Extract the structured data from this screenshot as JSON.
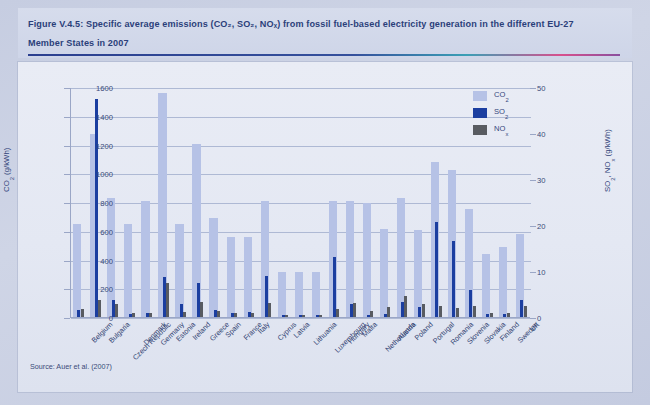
{
  "figure": {
    "title_line1": "Figure V.4.5: Specific average emissions (CO₂, SO₂, NOₓ) from fossil fuel-based electricity generation in the different EU-27",
    "title_line2": "Member States in 2007",
    "source": "Source: Auer et al. (2007)"
  },
  "colors": {
    "co2": "#b6c2e6",
    "so2": "#1b3ea0",
    "nox": "#585b61",
    "title_text": "#2b3f7a",
    "grid": "#aeb9d4",
    "panel_bg": "#e6eaf3"
  },
  "legend": {
    "position": "top-right",
    "entries": [
      {
        "label": "CO₂",
        "color": "#b6c2e6"
      },
      {
        "label": "SO₂",
        "color": "#1b3ea0"
      },
      {
        "label": "NOₓ",
        "color": "#585b61"
      }
    ]
  },
  "chart_data": {
    "type": "bar",
    "title": "Figure V.4.5: Specific average emissions (CO₂, SO₂, NOₓ) from fossil fuel-based electricity generation in the different EU-27 Member States in 2007",
    "xlabel": "",
    "ylabel": "CO₂ (g/kWh)",
    "y2label": "SO₂, NOₓ (g/kWh)",
    "ylim": [
      0,
      1600
    ],
    "y2lim": [
      0,
      50
    ],
    "yticks": [
      0,
      200,
      400,
      600,
      800,
      1000,
      1200,
      1400,
      1600
    ],
    "y2ticks": [
      0,
      10,
      20,
      30,
      40,
      50
    ],
    "grid": true,
    "legend_position": "top-right",
    "categories": [
      "Belgium",
      "Bulgaria",
      "Czech Republic",
      "Denmark",
      "Germany",
      "Estonia",
      "Ireland",
      "Greece",
      "Spain",
      "France",
      "Italy",
      "Cyprus",
      "Latvia",
      "Lithuania",
      "Luxembourg",
      "Hungary",
      "Malta",
      "Netherlands",
      "Austria",
      "Poland",
      "Portugal",
      "Romania",
      "Slovenia",
      "Slovakia",
      "Finland",
      "Sweden",
      "UK"
    ],
    "series": [
      {
        "name": "CO₂",
        "axis": "left",
        "unit": "g/kWh",
        "color": "#b6c2e6",
        "values": [
          650,
          1270,
          825,
          645,
          805,
          1555,
          645,
          1205,
          690,
          560,
          555,
          810,
          315,
          310,
          315,
          805,
          805,
          795,
          615,
          830,
          605,
          1080,
          1020,
          750,
          435,
          490,
          580
        ]
      },
      {
        "name": "SO₂",
        "axis": "right",
        "unit": "g/kWh",
        "color": "#1b3ea0",
        "values": [
          1.6,
          47.5,
          3.8,
          0.7,
          0.8,
          8.6,
          2.8,
          7.3,
          1.6,
          0.9,
          1.0,
          8.9,
          0.5,
          0.5,
          0.4,
          13.0,
          2.9,
          0.5,
          0.6,
          3.2,
          2.2,
          20.7,
          16.6,
          5.8,
          0.7,
          0.6,
          3.7
        ]
      },
      {
        "name": "NOₓ",
        "axis": "right",
        "unit": "g/kWh",
        "color": "#585b61",
        "values": [
          1.8,
          3.8,
          2.8,
          0.8,
          0.8,
          7.3,
          1.1,
          3.2,
          1.4,
          0.8,
          0.9,
          3.1,
          0.5,
          0.5,
          0.4,
          1.8,
          3.0,
          1.4,
          2.1,
          4.5,
          2.8,
          2.4,
          1.9,
          2.5,
          0.9,
          0.8,
          2.3
        ]
      }
    ]
  }
}
